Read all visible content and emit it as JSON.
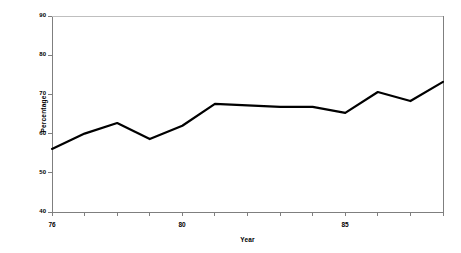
{
  "chart_data": {
    "type": "line",
    "title": "",
    "xlabel": "Year",
    "ylabel": "Percentage",
    "x": [
      76,
      77,
      78,
      79,
      80,
      81,
      82,
      83,
      84,
      85,
      86,
      87,
      88
    ],
    "categories": [
      "76",
      "77",
      "78",
      "79",
      "80",
      "81",
      "82",
      "83",
      "84",
      "85",
      "86",
      "87",
      "88"
    ],
    "values": [
      56.1,
      60.0,
      62.7,
      58.6,
      62.0,
      67.6,
      67.2,
      66.8,
      66.8,
      65.3,
      70.6,
      68.3,
      73.2
    ],
    "series": [
      {
        "name": "Percentage",
        "values": [
          56.1,
          60.0,
          62.7,
          58.6,
          62.0,
          67.6,
          67.2,
          66.8,
          66.8,
          65.3,
          70.6,
          68.3,
          73.2
        ]
      }
    ],
    "xlim": [
      76,
      88
    ],
    "ylim": [
      40,
      90
    ],
    "yticks": [
      40,
      50,
      60,
      70,
      80,
      90
    ],
    "ytick_labels": [
      "40",
      "50",
      "60",
      "70",
      "80",
      "90"
    ],
    "xticks": [
      76,
      77,
      78,
      79,
      80,
      81,
      82,
      83,
      84,
      85,
      86,
      87,
      88
    ],
    "xtick_labels_shown": [
      {
        "value": 76,
        "label": "76"
      },
      {
        "value": 80,
        "label": "80"
      },
      {
        "value": 85,
        "label": "85"
      }
    ],
    "grid": false,
    "legend": null,
    "line_color": "#000000",
    "axis_color": "#808080",
    "background_color": "#ffffff"
  }
}
